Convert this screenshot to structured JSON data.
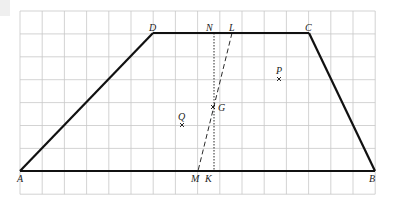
{
  "diagram": {
    "type": "trapezoid-on-grid",
    "grid": {
      "x0": 20,
      "y0": 11,
      "dx": 22.2,
      "dy": 22.9,
      "cols": 16,
      "rows": 8,
      "color": "#c8c8c8"
    },
    "points": {
      "A": {
        "label": "A",
        "x": 20,
        "y": 171
      },
      "B": {
        "label": "B",
        "x": 375,
        "y": 171
      },
      "C": {
        "label": "C",
        "x": 309,
        "y": 33
      },
      "D": {
        "label": "D",
        "x": 153,
        "y": 33
      },
      "N": {
        "label": "N",
        "x": 214,
        "y": 33
      },
      "L": {
        "label": "L",
        "x": 232,
        "y": 33
      },
      "M": {
        "label": "M",
        "x": 198,
        "y": 171
      },
      "K": {
        "label": "K",
        "x": 214,
        "y": 171
      },
      "G": {
        "label": "G",
        "x": 213,
        "y": 107
      },
      "P": {
        "label": "P",
        "x": 279,
        "y": 79
      },
      "Q": {
        "label": "Q",
        "x": 182,
        "y": 125
      }
    },
    "segments": [
      {
        "from": "A",
        "to": "B",
        "style": "solid"
      },
      {
        "from": "B",
        "to": "C",
        "style": "solid"
      },
      {
        "from": "C",
        "to": "D",
        "style": "solid"
      },
      {
        "from": "D",
        "to": "A",
        "style": "solid"
      },
      {
        "from": "N",
        "to": "K",
        "style": "dotted"
      },
      {
        "from": "L",
        "to": "M",
        "style": "dashed"
      }
    ]
  }
}
